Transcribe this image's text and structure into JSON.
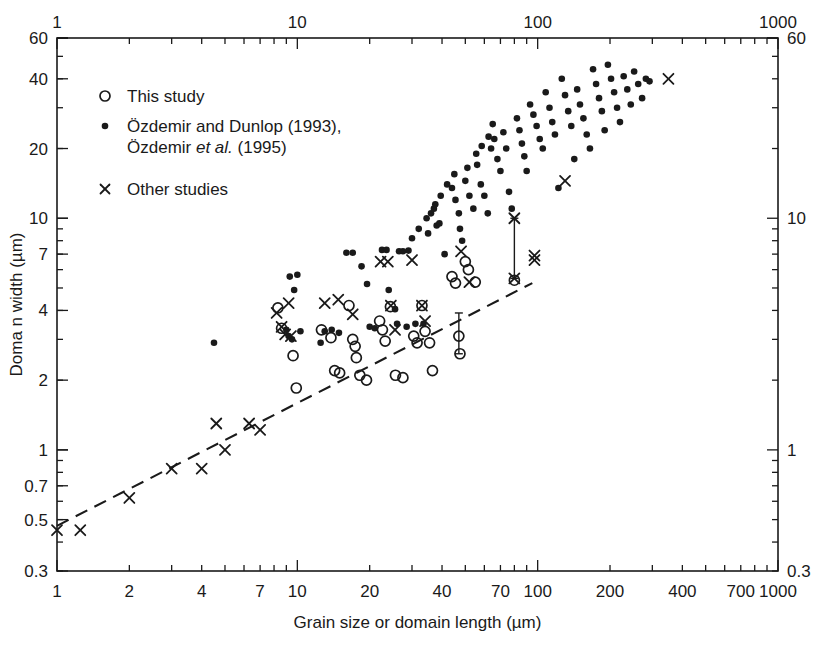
{
  "chart_data": {
    "type": "scatter",
    "title": "",
    "xlabel": "Grain size or domain length (µm)",
    "ylabel": "Doma n width (µm)",
    "xscale": "log",
    "yscale": "log",
    "xlim": [
      1,
      1000
    ],
    "ylim": [
      0.3,
      60
    ],
    "grid": false,
    "xticks_labeled": [
      1,
      2,
      4,
      7,
      10,
      20,
      40,
      70,
      100,
      200,
      400,
      700,
      1000
    ],
    "xtick_labels": [
      "1",
      "2",
      "4",
      "7",
      "10",
      "20",
      "40",
      "70",
      "100",
      "200",
      "400",
      "700",
      "1000"
    ],
    "xticks_top_labeled": [
      1,
      10,
      100,
      1000
    ],
    "xtick_top_labels": [
      "1",
      "10",
      "100",
      "1000"
    ],
    "yticks_labeled": [
      60,
      40,
      20,
      10,
      7,
      4,
      2,
      1,
      0.7,
      0.5,
      0.3
    ],
    "ytick_labels": [
      "60",
      "40",
      "20",
      "10",
      "7",
      "4",
      "2",
      "1",
      "0.7",
      "0.5",
      "0.3"
    ],
    "yticks_right_labeled": [
      60,
      10,
      1,
      0.3
    ],
    "ytick_right_labels": [
      "60",
      "10",
      "1",
      "0.3"
    ],
    "legend_position": "upper-left",
    "series": [
      {
        "name": "This study",
        "marker": "open-circle",
        "points": [
          [
            8.3,
            4.1
          ],
          [
            8.6,
            3.35
          ],
          [
            9.6,
            2.55
          ],
          [
            9.9,
            1.85
          ],
          [
            12.6,
            3.3
          ],
          [
            13.8,
            3.05
          ],
          [
            14.3,
            2.2
          ],
          [
            15.0,
            2.15
          ],
          [
            16.4,
            4.2
          ],
          [
            17.0,
            3.0
          ],
          [
            17.4,
            2.8
          ],
          [
            17.6,
            2.5
          ],
          [
            18.2,
            2.1
          ],
          [
            19.4,
            2.0
          ],
          [
            22.0,
            3.6
          ],
          [
            22.6,
            3.3
          ],
          [
            23.2,
            2.95
          ],
          [
            24.4,
            4.15
          ],
          [
            25.6,
            2.1
          ],
          [
            27.5,
            2.05
          ],
          [
            30.5,
            3.1
          ],
          [
            31.5,
            2.9
          ],
          [
            33.0,
            4.2
          ],
          [
            34.0,
            3.25
          ],
          [
            35.5,
            2.9
          ],
          [
            36.5,
            2.2
          ],
          [
            44.0,
            5.6
          ],
          [
            45.5,
            5.25
          ],
          [
            47.0,
            3.1
          ],
          [
            47.5,
            2.6
          ],
          [
            50.0,
            6.5
          ],
          [
            51.5,
            6.0
          ],
          [
            55.0,
            5.3
          ],
          [
            80.0,
            5.4
          ]
        ]
      },
      {
        "name": "Özdemir and Dunlop (1993), Özdemir et al. (1995)",
        "marker": "filled-dot",
        "points": [
          [
            4.5,
            2.9
          ],
          [
            9.0,
            3.3
          ],
          [
            9.3,
            5.6
          ],
          [
            10.0,
            5.7
          ],
          [
            9.7,
            4.9
          ],
          [
            10.3,
            3.25
          ],
          [
            9.2,
            3.1
          ],
          [
            9.5,
            3.0
          ],
          [
            13.0,
            3.25
          ],
          [
            13.9,
            3.3
          ],
          [
            14.9,
            3.2
          ],
          [
            12.5,
            2.9
          ],
          [
            16.0,
            7.1
          ],
          [
            17.0,
            7.1
          ],
          [
            18.5,
            6.2
          ],
          [
            19.5,
            5.2
          ],
          [
            20.0,
            3.4
          ],
          [
            21.0,
            3.35
          ],
          [
            22.5,
            7.3
          ],
          [
            23.5,
            7.3
          ],
          [
            26.5,
            7.2
          ],
          [
            27.5,
            7.2
          ],
          [
            29.0,
            7.25
          ],
          [
            24.0,
            4.9
          ],
          [
            25.5,
            4.05
          ],
          [
            26.0,
            3.5
          ],
          [
            28.5,
            3.4
          ],
          [
            31.0,
            3.5
          ],
          [
            33.5,
            3.5
          ],
          [
            35.0,
            8.6
          ],
          [
            36.0,
            10.5
          ],
          [
            37.0,
            11.0
          ],
          [
            38.0,
            9.3
          ],
          [
            39.0,
            9.5
          ],
          [
            41.0,
            7.0
          ],
          [
            44.0,
            13.5
          ],
          [
            45.5,
            12.0
          ],
          [
            47.0,
            10.5
          ],
          [
            47.5,
            9.0
          ],
          [
            48.5,
            8.0
          ],
          [
            50.0,
            14.5
          ],
          [
            52.0,
            12.5
          ],
          [
            54.0,
            11.0
          ],
          [
            56.0,
            17.0
          ],
          [
            58.0,
            14.0
          ],
          [
            60.0,
            12.5
          ],
          [
            62.0,
            10.5
          ],
          [
            64.0,
            20.0
          ],
          [
            66.0,
            22.0
          ],
          [
            68.0,
            18.0
          ],
          [
            70.0,
            16.0
          ],
          [
            72.0,
            23.5
          ],
          [
            74.0,
            20.0
          ],
          [
            76.0,
            13.0
          ],
          [
            78.0,
            11.0
          ],
          [
            82.0,
            27.0
          ],
          [
            84.0,
            24.0
          ],
          [
            86.0,
            21.0
          ],
          [
            88.0,
            18.5
          ],
          [
            90.0,
            16.0
          ],
          [
            93.0,
            31.0
          ],
          [
            96.0,
            28.0
          ],
          [
            99.0,
            25.0
          ],
          [
            102.0,
            22.0
          ],
          [
            105.0,
            20.0
          ],
          [
            108.0,
            35.0
          ],
          [
            112.0,
            30.0
          ],
          [
            115.0,
            26.0
          ],
          [
            118.0,
            23.0
          ],
          [
            122.0,
            13.5
          ],
          [
            126.0,
            40.0
          ],
          [
            130.0,
            34.0
          ],
          [
            134.0,
            29.0
          ],
          [
            138.0,
            25.0
          ],
          [
            142.0,
            18.0
          ],
          [
            146.0,
            36.0
          ],
          [
            150.0,
            31.0
          ],
          [
            155.0,
            27.0
          ],
          [
            160.0,
            23.0
          ],
          [
            165.0,
            20.0
          ],
          [
            170.0,
            44.0
          ],
          [
            175.0,
            38.0
          ],
          [
            180.0,
            33.0
          ],
          [
            185.0,
            29.0
          ],
          [
            190.0,
            24.0
          ],
          [
            196.0,
            46.0
          ],
          [
            202.0,
            40.0
          ],
          [
            208.0,
            35.0
          ],
          [
            214.0,
            30.0
          ],
          [
            220.0,
            26.0
          ],
          [
            228.0,
            41.0
          ],
          [
            236.0,
            36.0
          ],
          [
            244.0,
            31.0
          ],
          [
            252.0,
            43.0
          ],
          [
            262.0,
            38.0
          ],
          [
            272.0,
            33.0
          ],
          [
            282.0,
            40.0
          ],
          [
            292.0,
            39.0
          ],
          [
            62.5,
            22.5
          ],
          [
            65.0,
            25.5
          ],
          [
            58.5,
            20.5
          ],
          [
            55.5,
            19.0
          ],
          [
            51.0,
            16.5
          ],
          [
            45.0,
            15.5
          ],
          [
            42.0,
            14.0
          ],
          [
            39.5,
            12.5
          ],
          [
            37.5,
            11.5
          ],
          [
            34.5,
            10.0
          ],
          [
            32.0,
            9.0
          ],
          [
            30.0,
            8.2
          ]
        ]
      },
      {
        "name": "Other studies",
        "marker": "cross",
        "points": [
          [
            1.0,
            0.45
          ],
          [
            1.25,
            0.45
          ],
          [
            2.0,
            0.62
          ],
          [
            3.0,
            0.83
          ],
          [
            4.0,
            0.83
          ],
          [
            4.6,
            1.3
          ],
          [
            5.0,
            1.0
          ],
          [
            6.3,
            1.3
          ],
          [
            7.0,
            1.22
          ],
          [
            8.2,
            3.9
          ],
          [
            9.2,
            4.3
          ],
          [
            8.6,
            3.4
          ],
          [
            8.9,
            3.15
          ],
          [
            9.4,
            3.1
          ],
          [
            13.0,
            4.3
          ],
          [
            14.8,
            4.45
          ],
          [
            17.0,
            3.85
          ],
          [
            22.2,
            6.5
          ],
          [
            23.8,
            6.5
          ],
          [
            24.5,
            4.2
          ],
          [
            25.5,
            3.3
          ],
          [
            30.0,
            6.6
          ],
          [
            33.0,
            4.2
          ],
          [
            34.0,
            3.6
          ],
          [
            48.0,
            7.2
          ],
          [
            52.0,
            5.3
          ],
          [
            80.0,
            10.0
          ],
          [
            80.0,
            5.5
          ],
          [
            97.0,
            6.9
          ],
          [
            97.0,
            6.6
          ],
          [
            130.0,
            14.5
          ],
          [
            350.0,
            40.0
          ]
        ]
      }
    ],
    "trend_line": {
      "style": "dashed",
      "x": [
        1.0,
        95.0
      ],
      "y": [
        0.47,
        5.25
      ]
    },
    "error_bars": [
      {
        "x": 80.0,
        "y_low": 5.5,
        "y_high": 10.0
      },
      {
        "x": 47.0,
        "y_low": 2.6,
        "y_high": 3.9
      }
    ]
  },
  "legend": {
    "entries": [
      {
        "marker": "open-circle",
        "label": "This study"
      },
      {
        "marker": "filled-dot",
        "label_line1_a": "Özdemir and Dunlop (1993),",
        "label_line2_a": "Özdemir ",
        "label_line2_it": "et al.",
        "label_line2_b": " (1995)"
      },
      {
        "marker": "cross",
        "label": "Other studies"
      }
    ]
  }
}
